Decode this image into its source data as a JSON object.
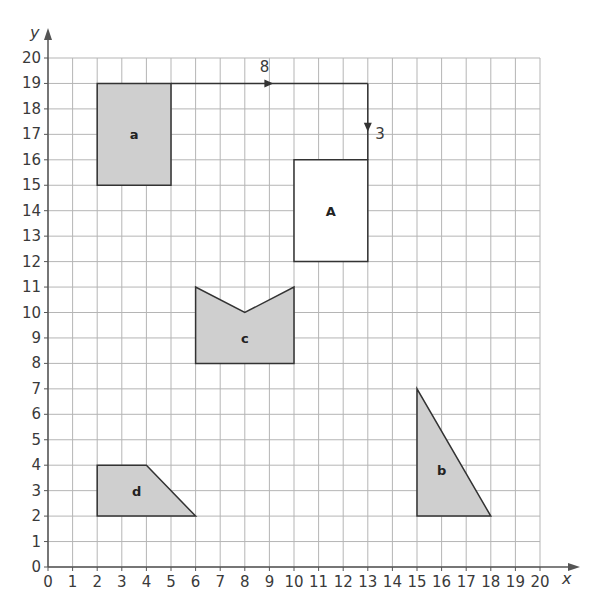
{
  "axes": {
    "x_label": "x",
    "y_label": "y",
    "x_ticks": [
      "0",
      "1",
      "2",
      "3",
      "4",
      "5",
      "6",
      "7",
      "8",
      "9",
      "10",
      "11",
      "12",
      "13",
      "14",
      "15",
      "16",
      "17",
      "18",
      "19",
      "20"
    ],
    "y_ticks": [
      "0",
      "1",
      "2",
      "3",
      "4",
      "5",
      "6",
      "7",
      "8",
      "9",
      "10",
      "11",
      "12",
      "13",
      "14",
      "15",
      "16",
      "17",
      "18",
      "19",
      "20"
    ],
    "range": {
      "xmin": 0,
      "xmax": 20,
      "ymin": 0,
      "ymax": 20
    }
  },
  "colors": {
    "grid": "#b5b5b5",
    "axis": "#555555",
    "shape_fill": "#cfcfcf",
    "shape_stroke": "#333333",
    "outline_fill": "#ffffff"
  },
  "shapes": [
    {
      "id": "a",
      "label": "a",
      "shaded": true,
      "points": [
        [
          2,
          15
        ],
        [
          5,
          15
        ],
        [
          5,
          19
        ],
        [
          2,
          19
        ]
      ],
      "label_pos": [
        3.5,
        17
      ]
    },
    {
      "id": "A",
      "label": "A",
      "shaded": false,
      "points": [
        [
          10,
          12
        ],
        [
          13,
          12
        ],
        [
          13,
          16
        ],
        [
          10,
          16
        ]
      ],
      "label_pos": [
        11.5,
        14
      ]
    },
    {
      "id": "c",
      "label": "c",
      "shaded": true,
      "points": [
        [
          6,
          8
        ],
        [
          10,
          8
        ],
        [
          10,
          11
        ],
        [
          8,
          10
        ],
        [
          6,
          11
        ]
      ],
      "label_pos": [
        8,
        9
      ]
    },
    {
      "id": "b",
      "label": "b",
      "shaded": true,
      "points": [
        [
          15,
          2
        ],
        [
          18,
          2
        ],
        [
          15,
          7
        ]
      ],
      "label_pos": [
        16,
        3.8
      ]
    },
    {
      "id": "d",
      "label": "d",
      "shaded": true,
      "points": [
        [
          2,
          2
        ],
        [
          6,
          2
        ],
        [
          4,
          4
        ],
        [
          2,
          4
        ]
      ],
      "label_pos": [
        3.6,
        3
      ]
    }
  ],
  "translation": {
    "horizontal": {
      "label": "8",
      "from": [
        5,
        19
      ],
      "to": [
        13,
        19
      ],
      "arrow_at": [
        9,
        19
      ],
      "label_pos": [
        8.8,
        19.45
      ]
    },
    "vertical": {
      "label": "3",
      "from": [
        13,
        19
      ],
      "to": [
        13,
        16
      ],
      "arrow_at": [
        13,
        17.3
      ],
      "label_pos": [
        13.5,
        17
      ]
    }
  }
}
